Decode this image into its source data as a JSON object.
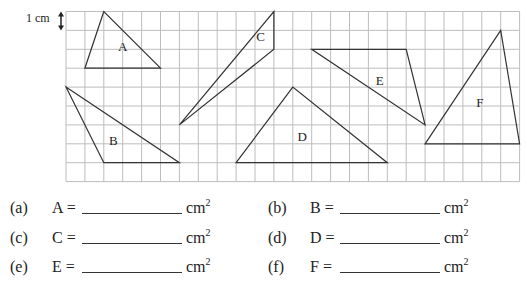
{
  "figure": {
    "scale_label": "1 cm",
    "grid": {
      "columns": 24,
      "rows": 9,
      "line_color": "#bdbdbd",
      "shape_color": "#333333"
    },
    "shapes": [
      {
        "label": "A",
        "vertices": [
          [
            2,
            0
          ],
          [
            1,
            3
          ],
          [
            5,
            3
          ]
        ],
        "label_at": [
          3,
          1.8
        ]
      },
      {
        "label": "B",
        "vertices": [
          [
            0,
            4
          ],
          [
            2,
            8
          ],
          [
            6,
            8
          ]
        ],
        "label_at": [
          2.5,
          6.8
        ]
      },
      {
        "label": "C",
        "vertices": [
          [
            11,
            0
          ],
          [
            11,
            2
          ],
          [
            6,
            6
          ]
        ],
        "label_at": [
          10.3,
          1.3
        ]
      },
      {
        "label": "D",
        "vertices": [
          [
            9,
            8
          ],
          [
            12,
            4
          ],
          [
            17,
            8
          ]
        ],
        "label_at": [
          12.5,
          6.6
        ]
      },
      {
        "label": "E",
        "vertices": [
          [
            13,
            2
          ],
          [
            18,
            2
          ],
          [
            19,
            6
          ]
        ],
        "label_at": [
          16.6,
          3.6
        ]
      },
      {
        "label": "F",
        "vertices": [
          [
            19,
            7
          ],
          [
            23,
            1
          ],
          [
            24,
            7
          ]
        ],
        "label_at": [
          21.9,
          4.8
        ]
      }
    ]
  },
  "answers": [
    {
      "tag": "(a)",
      "lhs": "A =",
      "unit": "cm",
      "exp": "2"
    },
    {
      "tag": "(b)",
      "lhs": "B =",
      "unit": "cm",
      "exp": "2"
    },
    {
      "tag": "(c)",
      "lhs": "C =",
      "unit": "cm",
      "exp": "2"
    },
    {
      "tag": "(d)",
      "lhs": "D =",
      "unit": "cm",
      "exp": "2"
    },
    {
      "tag": "(e)",
      "lhs": "E =",
      "unit": "cm",
      "exp": "2"
    },
    {
      "tag": "(f)",
      "lhs": "F =",
      "unit": "cm",
      "exp": "2"
    }
  ]
}
